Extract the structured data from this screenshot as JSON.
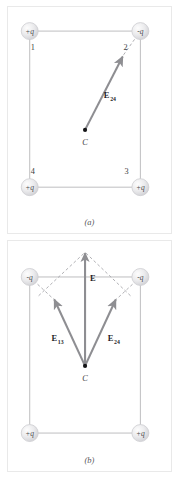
{
  "figure": {
    "colors": {
      "background": "#ffffff",
      "panel_border": "#e9e9e9",
      "rectangle_line": "#b9b9bb",
      "vector_arrow": "#8e8e92",
      "dashed_construction": "#9a9a9e",
      "charge_sphere_fill": "#e4e4e6",
      "charge_sphere_edge": "#c6c6ca",
      "label_text": "#3a3a3c",
      "point_dot": "#111113"
    }
  },
  "panels": [
    {
      "id": "a",
      "caption": "(a)",
      "charges": [
        {
          "corner_number": "1",
          "sign_label": "+q",
          "position": "top-left"
        },
        {
          "corner_number": "2",
          "sign_label": "-q",
          "position": "top-right"
        },
        {
          "corner_number": "3",
          "sign_label": "+q",
          "position": "bottom-right"
        },
        {
          "corner_number": "4",
          "sign_label": "+q",
          "position": "bottom-left"
        }
      ],
      "center_point": {
        "label": "C"
      },
      "vectors": [
        {
          "name": "E24",
          "label_main": "E",
          "label_sub": "24",
          "from": "center",
          "to": "toward-corner-2",
          "style": "solid-arrow",
          "has_dashed_extension": true
        }
      ]
    },
    {
      "id": "b",
      "caption": "(b)",
      "charges": [
        {
          "corner_number": "",
          "sign_label": "-q",
          "position": "top-left"
        },
        {
          "corner_number": "",
          "sign_label": "-q",
          "position": "top-right"
        },
        {
          "corner_number": "",
          "sign_label": "+q",
          "position": "bottom-right"
        },
        {
          "corner_number": "",
          "sign_label": "+q",
          "position": "bottom-left"
        }
      ],
      "center_point": {
        "label": "C"
      },
      "vectors": [
        {
          "name": "E13",
          "label_main": "E",
          "label_sub": "13",
          "from": "center",
          "to": "upper-left",
          "style": "solid-arrow",
          "has_dashed_extension": true
        },
        {
          "name": "E24",
          "label_main": "E",
          "label_sub": "24",
          "from": "center",
          "to": "upper-right",
          "style": "solid-arrow",
          "has_dashed_extension": true
        },
        {
          "name": "E",
          "label_main": "E",
          "label_sub": "",
          "from": "center",
          "to": "straight-up",
          "style": "solid-arrow-resultant",
          "has_dashed_extension": false
        }
      ]
    }
  ]
}
